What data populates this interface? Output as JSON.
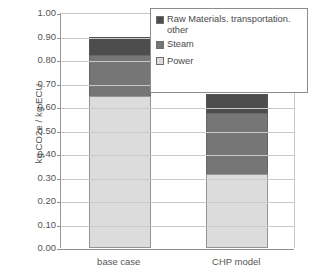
{
  "chart_data": {
    "type": "bar",
    "subtype": "stacked-bar",
    "title": "",
    "xlabel": "",
    "ylabel": "kg CO2e / kg ECU",
    "ylim": [
      0.0,
      1.0
    ],
    "ytick_step": 0.1,
    "ytick_labels": [
      "1.00",
      "0.90",
      "0.80",
      "0.70",
      "0.60",
      "0.50",
      "0.40",
      "0.30",
      "0.20",
      "0.10",
      "0.00"
    ],
    "ytick_values": [
      1.0,
      0.9,
      0.8,
      0.7,
      0.6,
      0.5,
      0.4,
      0.3,
      0.2,
      0.1,
      0.0
    ],
    "grid": true,
    "grid_axis": "y",
    "legend_position": "top-right-inside",
    "categories": [
      "base case",
      "CHP model"
    ],
    "series": [
      {
        "name": "Power",
        "color": "#dcdcdc",
        "values": [
          0.645,
          0.315
        ]
      },
      {
        "name": "Steam",
        "color": "#767676",
        "values": [
          0.175,
          0.26
        ]
      },
      {
        "name": "Raw Materials. transportation. other",
        "color": "#4d4d4d",
        "values": [
          0.08,
          0.08
        ]
      }
    ],
    "stack_order_bottom_to_top": [
      "Power",
      "Steam",
      "Raw Materials. transportation. other"
    ],
    "totals": [
      0.9,
      0.655
    ]
  },
  "legend": {
    "entries": [
      {
        "label": "Raw Materials. transportation. other",
        "color": "#4d4d4d"
      },
      {
        "label": "Steam",
        "color": "#767676"
      },
      {
        "label": "Power",
        "color": "#dcdcdc"
      }
    ]
  },
  "axis": {
    "y_title": "kg CO2e / kg ECU"
  }
}
